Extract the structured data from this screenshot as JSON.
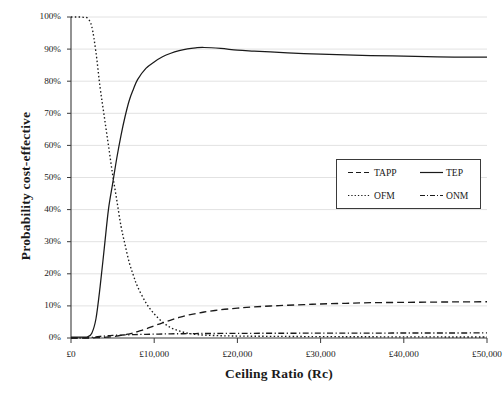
{
  "chart_data": {
    "type": "line",
    "title": "",
    "xlabel": "Ceiling Ratio (Rc)",
    "ylabel": "Probability cost-effective",
    "xlim": [
      0,
      50000
    ],
    "ylim": [
      0,
      1
    ],
    "grid": "horizontal",
    "legend_position": "center-right",
    "xticks": [
      "£0",
      "£10,000",
      "£20,000",
      "£30,000",
      "£40,000",
      "£50,000"
    ],
    "xtick_values": [
      0,
      10000,
      20000,
      30000,
      40000,
      50000
    ],
    "yticks": [
      "0%",
      "10%",
      "20%",
      "30%",
      "40%",
      "50%",
      "60%",
      "70%",
      "80%",
      "90%",
      "100%"
    ],
    "ytick_values": [
      0,
      10,
      20,
      30,
      40,
      50,
      60,
      70,
      80,
      90,
      100
    ],
    "x": [
      0,
      500,
      1000,
      1500,
      2000,
      2500,
      3000,
      3500,
      4000,
      4500,
      5000,
      5500,
      6000,
      6500,
      7000,
      7500,
      8000,
      9000,
      10000,
      11000,
      12000,
      13000,
      14000,
      15000,
      16000,
      18000,
      20000,
      22000,
      25000,
      28000,
      30000,
      33000,
      36000,
      40000,
      44000,
      47000,
      50000
    ],
    "series": [
      {
        "name": "TAPP",
        "style": "dashed",
        "color": "#1a1a1a",
        "values": [
          0.0,
          0.0,
          0.0,
          0.0,
          0.0,
          0.0,
          0.1,
          0.1,
          0.2,
          0.3,
          0.4,
          0.6,
          0.8,
          1.0,
          1.3,
          1.6,
          2.0,
          2.8,
          3.8,
          4.7,
          5.6,
          6.4,
          7.1,
          7.6,
          8.1,
          8.8,
          9.3,
          9.7,
          10.1,
          10.4,
          10.6,
          10.8,
          11.0,
          11.1,
          11.2,
          11.25,
          11.3
        ]
      },
      {
        "name": "TEP",
        "style": "solid",
        "color": "#1a1a1a",
        "values": [
          0.3,
          0.3,
          0.3,
          0.3,
          0.4,
          1.5,
          6.0,
          16.0,
          28.0,
          40.0,
          48.0,
          56.0,
          63.0,
          69.0,
          74.0,
          77.5,
          80.5,
          84.0,
          86.0,
          87.6,
          88.7,
          89.5,
          90.1,
          90.4,
          90.5,
          90.2,
          89.7,
          89.4,
          89.0,
          88.6,
          88.4,
          88.2,
          88.0,
          87.8,
          87.6,
          87.5,
          87.5
        ]
      },
      {
        "name": "OFM",
        "style": "dotted",
        "color": "#1a1a1a",
        "values": [
          100.0,
          100.0,
          100.0,
          99.9,
          99.6,
          97.0,
          89.0,
          78.0,
          69.0,
          60.0,
          51.0,
          43.0,
          35.0,
          29.0,
          23.5,
          19.5,
          16.0,
          11.0,
          7.5,
          5.0,
          3.2,
          2.2,
          1.5,
          1.1,
          0.9,
          0.7,
          0.6,
          0.55,
          0.5,
          0.45,
          0.42,
          0.4,
          0.38,
          0.35,
          0.33,
          0.32,
          0.3
        ]
      },
      {
        "name": "ONM",
        "style": "dashdot",
        "color": "#1a1a1a",
        "values": [
          0.0,
          0.0,
          0.0,
          0.05,
          0.1,
          0.2,
          0.35,
          0.5,
          0.6,
          0.7,
          0.8,
          0.85,
          0.9,
          0.95,
          1.0,
          1.05,
          1.1,
          1.15,
          1.2,
          1.25,
          1.3,
          1.32,
          1.35,
          1.38,
          1.4,
          1.42,
          1.45,
          1.46,
          1.48,
          1.5,
          1.5,
          1.52,
          1.53,
          1.55,
          1.56,
          1.57,
          1.58
        ]
      }
    ]
  },
  "legend": {
    "items": [
      {
        "label": "TAPP",
        "style": "dashed"
      },
      {
        "label": "TEP",
        "style": "solid"
      },
      {
        "label": "OFM",
        "style": "dotted"
      },
      {
        "label": "ONM",
        "style": "dashdot"
      }
    ]
  },
  "axes": {
    "x_title": "Ceiling Ratio (Rc)",
    "y_title": "Probability cost-effective"
  }
}
